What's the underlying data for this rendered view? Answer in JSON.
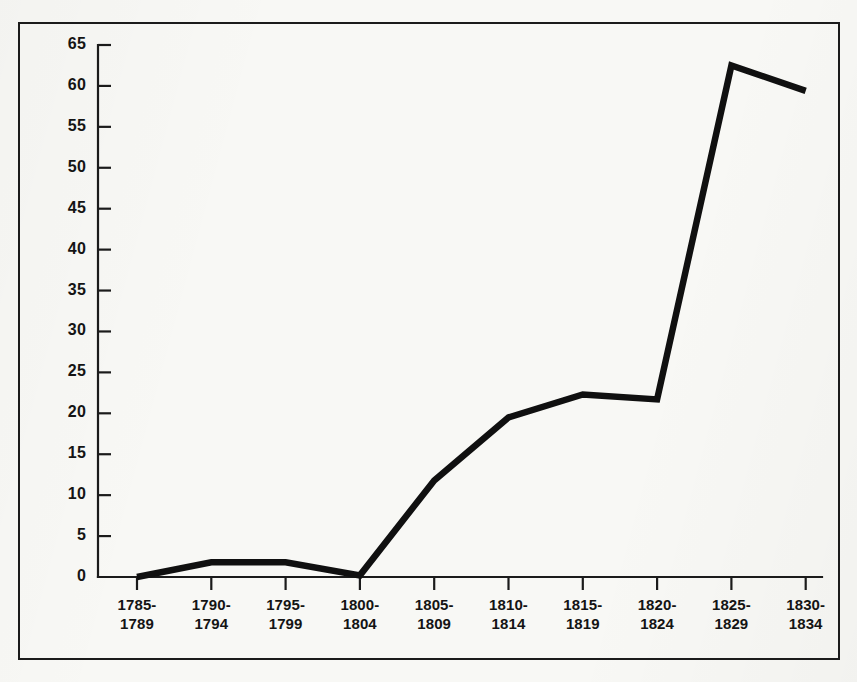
{
  "figure": {
    "background_color": "#f8f8f5",
    "frame_color": "#1b1b1b",
    "line_color": "#101010",
    "axis_color": "#1b1b1b",
    "text_color": "#141414"
  },
  "chart_data": {
    "type": "line",
    "title": "",
    "subtitle": "",
    "xlabel": "",
    "ylabel": "",
    "categories": [
      "1785-\n1789",
      "1790-\n1794",
      "1795-\n1799",
      "1800-\n1804",
      "1805-\n1809",
      "1810-\n1814",
      "1815-\n1819",
      "1820-\n1824",
      "1825-\n1829",
      "1830-\n1834"
    ],
    "category_lines": [
      [
        "1785-",
        "1789"
      ],
      [
        "1790-",
        "1794"
      ],
      [
        "1795-",
        "1799"
      ],
      [
        "1800-",
        "1804"
      ],
      [
        "1805-",
        "1809"
      ],
      [
        "1810-",
        "1814"
      ],
      [
        "1815-",
        "1819"
      ],
      [
        "1820-",
        "1824"
      ],
      [
        "1825-",
        "1829"
      ],
      [
        "1830-",
        "1834"
      ]
    ],
    "values": [
      0,
      1.8,
      1.8,
      0.2,
      11.8,
      19.5,
      22.3,
      21.7,
      62.5,
      59.4
    ],
    "ylim": [
      0,
      65
    ],
    "ytick_values": [
      0,
      5,
      10,
      15,
      20,
      25,
      30,
      35,
      40,
      45,
      50,
      55,
      60,
      65
    ],
    "ytick_labels": [
      "0",
      "5",
      "10",
      "15",
      "20",
      "25",
      "30",
      "35",
      "40",
      "45",
      "50",
      "55",
      "60",
      "65"
    ],
    "grid": false,
    "legend": false,
    "legend_position": "none",
    "series": [
      {
        "name": "",
        "values": [
          0,
          1.8,
          1.8,
          0.2,
          11.8,
          19.5,
          22.3,
          21.7,
          62.5,
          59.4
        ]
      }
    ],
    "annotations": []
  }
}
